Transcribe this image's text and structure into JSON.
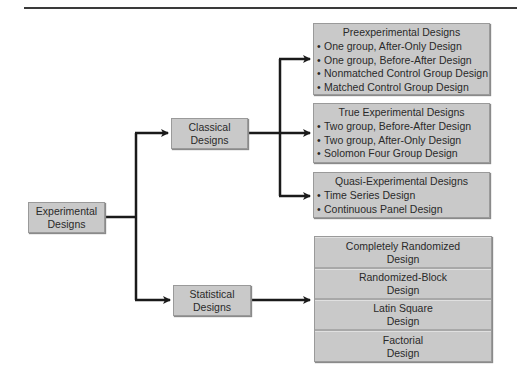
{
  "diagram": {
    "root": {
      "line1": "Experimental",
      "line2": "Designs"
    },
    "classical": {
      "line1": "Classical",
      "line2": "Designs"
    },
    "statistical": {
      "line1": "Statistical",
      "line2": "Designs"
    },
    "preexperimental": {
      "title": "Preexperimental Designs",
      "items": [
        "One group, After-Only Design",
        "One group, Before-After Design",
        "Nonmatched Control Group Design",
        "Matched Control Group Design"
      ]
    },
    "true_experimental": {
      "title": "True Experimental Designs",
      "items": [
        "Two group, Before-After Design",
        "Two group, After-Only Design",
        "Solomon Four Group Design"
      ]
    },
    "quasi_experimental": {
      "title": "Quasi-Experimental Designs",
      "items": [
        "Time Series Design",
        "Continuous Panel Design"
      ]
    },
    "statistical_designs": [
      {
        "line1": "Completely Randomized",
        "line2": "Design"
      },
      {
        "line1": "Randomized-Block",
        "line2": "Design"
      },
      {
        "line1": "Latin Square",
        "line2": "Design"
      },
      {
        "line1": "Factorial",
        "line2": "Design"
      }
    ],
    "bullet": "•",
    "colors": {
      "box_fill": "#c9c9c9",
      "line": "#1a1a1a",
      "text": "#2a2a2a"
    }
  }
}
